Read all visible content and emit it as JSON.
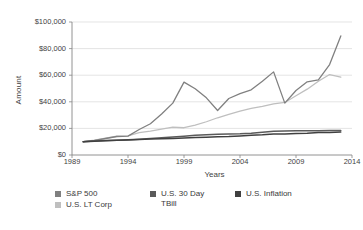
{
  "chart_data": {
    "type": "line",
    "title": "",
    "xlabel": "Years",
    "ylabel": "Amount",
    "xlim": [
      1989,
      2014
    ],
    "ylim": [
      0,
      100000
    ],
    "grid": true,
    "legend_position": "bottom",
    "x_ticks": [
      "1989",
      "1994",
      "1999",
      "2004",
      "2009",
      "2014"
    ],
    "y_ticks": [
      "$0",
      "$20,000",
      "$40,000",
      "$60,000",
      "$80,000",
      "$100,000"
    ],
    "x": [
      1990,
      1991,
      1992,
      1993,
      1994,
      1995,
      1996,
      1997,
      1998,
      1999,
      2000,
      2001,
      2002,
      2003,
      2004,
      2005,
      2006,
      2007,
      2008,
      2009,
      2010,
      2011,
      2012,
      2013
    ],
    "series": [
      {
        "name": "S&P 500",
        "color": "#808080",
        "values": [
          10000,
          11000,
          12400,
          13900,
          14200,
          19200,
          23500,
          30800,
          39000,
          54800,
          49800,
          43000,
          33500,
          42500,
          46200,
          49000,
          55500,
          62500,
          39000,
          48500,
          55000,
          56500,
          68000,
          89500
        ]
      },
      {
        "name": "U.S. LT Corp",
        "color": "#bfbfbf",
        "values": [
          10000,
          11100,
          12600,
          14100,
          14400,
          16900,
          18000,
          19500,
          21000,
          20500,
          22500,
          25000,
          28000,
          30500,
          33000,
          35000,
          36500,
          38500,
          39500,
          44500,
          49500,
          55500,
          60500,
          58500
        ]
      },
      {
        "name": "U.S. 30 Day TBill",
        "color": "#5a5a5a",
        "values": [
          10000,
          10550,
          10900,
          11150,
          11450,
          11900,
          12400,
          12900,
          13500,
          14100,
          14800,
          15300,
          15600,
          15750,
          15950,
          16400,
          17100,
          17800,
          18100,
          18200,
          18250,
          18300,
          18350,
          18500
        ]
      },
      {
        "name": "U.S. Inflation",
        "color": "#404040",
        "values": [
          10000,
          10420,
          10720,
          11020,
          11320,
          11620,
          11980,
          12180,
          12380,
          12700,
          13130,
          13350,
          13650,
          13900,
          14350,
          14850,
          15200,
          15800,
          15850,
          16100,
          16350,
          16850,
          17000,
          17200
        ]
      }
    ]
  },
  "axes": {
    "y_title": "Amount",
    "x_title": "Years"
  },
  "legend": {
    "items": [
      {
        "label": "S&P 500",
        "color": "#808080"
      },
      {
        "label": "U.S. LT Corp",
        "color": "#bfbfbf"
      },
      {
        "label": "U.S. 30 Day\nTBill",
        "color": "#5a5a5a"
      },
      {
        "label": "U.S. Inflation",
        "color": "#404040"
      }
    ]
  },
  "style": {
    "background": "#ffffff",
    "grid_color": "#d9d9d9",
    "axis_color": "#868686",
    "text_color": "#3a3a3a"
  }
}
